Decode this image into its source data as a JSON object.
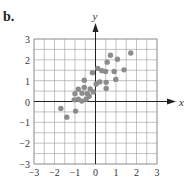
{
  "panel_label": "b.",
  "colors": {
    "grid": "#9a9a9a",
    "axis": "#222222",
    "point": "#8c8c8c",
    "text": "#333333"
  },
  "chart_data": {
    "type": "scatter",
    "title": "",
    "xlabel": "x",
    "ylabel": "y",
    "xlim": [
      -3,
      3
    ],
    "ylim": [
      -3,
      3
    ],
    "grid": true,
    "grid_step": 0.5,
    "x_ticks": [
      "-3",
      "-2",
      "-1",
      "0",
      "1",
      "2",
      "3"
    ],
    "y_ticks": [
      "-3",
      "-2",
      "-1",
      "0",
      "1",
      "2",
      "3"
    ],
    "points": [
      [
        -1.69,
        -0.33
      ],
      [
        -1.4,
        -0.75
      ],
      [
        -0.97,
        -0.46
      ],
      [
        -1.04,
        0.08
      ],
      [
        -0.84,
        0.11
      ],
      [
        -1.0,
        0.37
      ],
      [
        -0.84,
        0.59
      ],
      [
        -0.67,
        0.02
      ],
      [
        -0.66,
        0.4
      ],
      [
        -0.55,
        0.67
      ],
      [
        -0.55,
        1.02
      ],
      [
        -0.46,
        0.11
      ],
      [
        -0.4,
        0.38
      ],
      [
        -0.31,
        0.25
      ],
      [
        -0.26,
        0.6
      ],
      [
        -0.11,
        0.46
      ],
      [
        -0.15,
        1.38
      ],
      [
        0.03,
        0.84
      ],
      [
        0.11,
        1.59
      ],
      [
        0.21,
        0.94
      ],
      [
        0.31,
        1.48
      ],
      [
        0.49,
        1.44
      ],
      [
        0.52,
        0.92
      ],
      [
        0.52,
        0.63
      ],
      [
        0.57,
        1.89
      ],
      [
        0.73,
        2.22
      ],
      [
        0.91,
        1.44
      ],
      [
        0.99,
        1.06
      ],
      [
        1.07,
        2.03
      ],
      [
        1.39,
        1.52
      ],
      [
        1.72,
        2.33
      ]
    ]
  }
}
